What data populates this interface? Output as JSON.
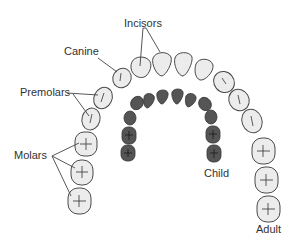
{
  "diagram": {
    "labels": {
      "incisors": "Incisors",
      "canine": "Canine",
      "premolars": "Premolars",
      "molars": "Molars",
      "child": "Child",
      "adult": "Adult"
    },
    "colors": {
      "adult_fill": "#ececec",
      "adult_stroke": "#4a4a4a",
      "child_fill": "#555555",
      "child_stroke": "#333333",
      "text": "#333333",
      "leader": "#444444"
    },
    "adult_arch": {
      "tooth_count_shown": 16,
      "groups": [
        "incisors",
        "canine",
        "premolars",
        "molars"
      ]
    },
    "child_arch": {
      "tooth_count_shown": 11
    }
  }
}
